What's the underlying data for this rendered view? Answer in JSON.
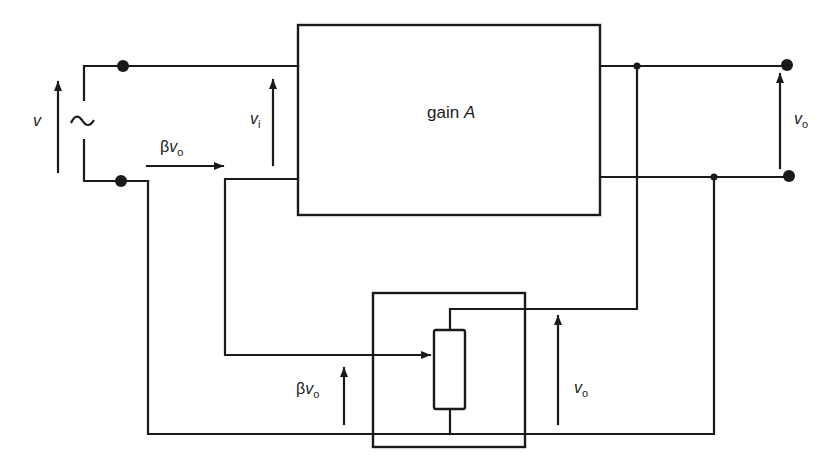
{
  "diagram": {
    "type": "feedback-amplifier-block-diagram",
    "amplifier": {
      "label_prefix": "gain ",
      "label_symbol": "A"
    },
    "source": {
      "symbol": "~",
      "voltage_label": "v"
    },
    "labels": {
      "input_voltage": {
        "main": "v",
        "sub": "i"
      },
      "feedback_arrow_top": {
        "beta": "β",
        "main": "v",
        "sub": "o"
      },
      "feedback_arrow_bottom": {
        "beta": "β",
        "main": "v",
        "sub": "o"
      },
      "output_voltage": {
        "main": "v",
        "sub": "o"
      },
      "feedback_network_voltage": {
        "main": "v",
        "sub": "o"
      }
    },
    "colors": {
      "line": "#1a1a1a",
      "background": "#ffffff"
    }
  }
}
